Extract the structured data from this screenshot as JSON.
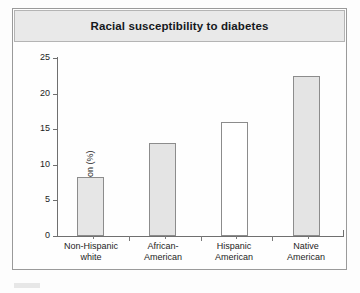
{
  "figure": {
    "title": "Racial susceptibility to diabetes"
  },
  "chart_data": {
    "type": "bar",
    "title": "Racial susceptibility to diabetes",
    "xlabel": "",
    "ylabel": "Adult population (%)",
    "categories": [
      "Non-Hispanic white",
      "African-American",
      "Hispanic American",
      "Native American"
    ],
    "category_lines": [
      [
        "Non-Hispanic",
        "white"
      ],
      [
        "African-",
        "American"
      ],
      [
        "Hispanic",
        "American"
      ],
      [
        "Native",
        "American"
      ]
    ],
    "values": [
      8.3,
      13.0,
      16.0,
      22.5
    ],
    "ylim": [
      0,
      25
    ],
    "yticks": [
      0,
      5,
      10,
      15,
      20,
      25
    ],
    "ytick_labels": [
      "0",
      "5",
      "10",
      "15",
      "20",
      "25"
    ],
    "grid": false,
    "legend": null,
    "bar_fills": [
      "#e6e6e6",
      "#e4e4e4",
      "#ffffff",
      "#e4e4e4"
    ],
    "bar_edge_color": "#8c8c8c"
  },
  "colors": {
    "banner_background": "#e9e9e9",
    "frame_border": "#9a9a9a",
    "axis": "#6f6f6f",
    "text": "#1d1d1d",
    "page_background": "#fdfdfd"
  }
}
